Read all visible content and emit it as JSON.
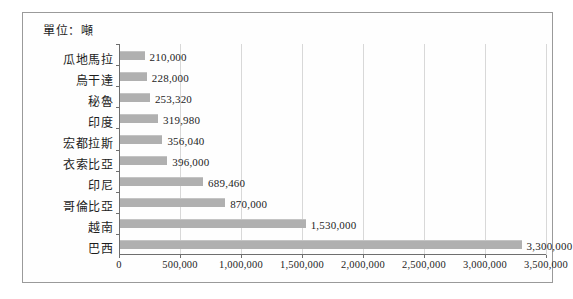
{
  "chart_data": {
    "type": "bar",
    "orientation": "horizontal",
    "title": "單位：噸",
    "xlabel": "",
    "ylabel": "",
    "xlim": [
      0,
      3500000
    ],
    "grid": true,
    "legend": false,
    "categories": [
      "瓜地馬拉",
      "烏干達",
      "秘魯",
      "印度",
      "宏都拉斯",
      "衣索比亞",
      "印尼",
      "哥倫比亞",
      "越南",
      "巴西"
    ],
    "values": [
      210000,
      228000,
      253320,
      319980,
      356040,
      396000,
      689460,
      870000,
      1530000,
      3300000
    ],
    "value_labels": [
      "210,000",
      "228,000",
      "253,320",
      "319,980",
      "356,040",
      "396,000",
      "689,460",
      "870,000",
      "1,530,000",
      "3,300,000"
    ],
    "xticks": [
      0,
      500000,
      1000000,
      1500000,
      2000000,
      2500000,
      3000000,
      3500000
    ],
    "xtick_labels": [
      "0",
      "500,000",
      "1,000,000",
      "1,500,000",
      "2,000,000",
      "2,500,000",
      "3,000,000",
      "3,500,000"
    ],
    "bar_color": "#b0b0b0",
    "grid_color": "#d8d8d8",
    "axis_color": "#6e6e6e",
    "text_color": "#1d1d1d"
  }
}
